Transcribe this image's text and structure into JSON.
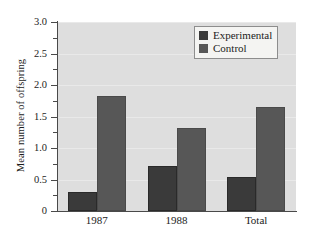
{
  "chart_data": {
    "type": "bar",
    "title": "",
    "subtitle": "",
    "xlabel": "",
    "ylabel": "Mean number of offspring",
    "categories": [
      "1987",
      "1988",
      "Total"
    ],
    "series": [
      {
        "name": "Experimental",
        "color": "#3a3a3a",
        "values": [
          0.3,
          0.71,
          0.54
        ]
      },
      {
        "name": "Control",
        "color": "#575757",
        "values": [
          1.83,
          1.32,
          1.65
        ]
      }
    ],
    "ylim": [
      0,
      3.0
    ],
    "ytick_labels": [
      "0",
      "0.5",
      "1.0",
      "1.5",
      "2.0",
      "2.5",
      "3.0"
    ],
    "ytick_values": [
      0,
      0.5,
      1.0,
      1.5,
      2.0,
      2.5,
      3.0
    ],
    "yminor_values": [
      0.25,
      0.75,
      1.25,
      1.75,
      2.25,
      2.75
    ],
    "grid": true,
    "legend_position": "top-right",
    "legend_entries": [
      "Experimental",
      "Control"
    ],
    "plot_background": "#dedede",
    "figure_background": "#ffffff"
  }
}
